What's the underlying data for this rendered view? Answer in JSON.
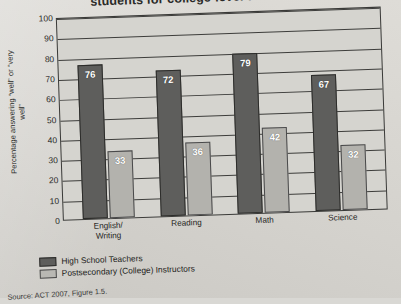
{
  "title": "students for college-level work?”",
  "title_right_fragment": "",
  "source": "Source: ACT 2007, Figure 1.5.",
  "legend": {
    "items": [
      {
        "label": "High School Teachers",
        "color": "#5e5e5c"
      },
      {
        "label": "Postsecondary (College) Instructors",
        "color": "#b9b8b3"
      }
    ]
  },
  "chart_data": {
    "type": "bar",
    "title": "students for college-level work?”",
    "xlabel": "",
    "ylabel": "Percentage answering “well” or “very well”",
    "ylim": [
      0,
      100
    ],
    "yticks": [
      0,
      10,
      20,
      30,
      40,
      50,
      60,
      70,
      80,
      90,
      100
    ],
    "grid": true,
    "legend_position": "below",
    "categories": [
      "English/\nWriting",
      "Reading",
      "Math",
      "Science"
    ],
    "category_labels": [
      {
        "line1": "English/",
        "line2": "Writing"
      },
      {
        "line1": "Reading",
        "line2": ""
      },
      {
        "line1": "Math",
        "line2": ""
      },
      {
        "line1": "Science",
        "line2": ""
      }
    ],
    "series": [
      {
        "name": "High School Teachers",
        "color": "#5e5e5c",
        "values": [
          76,
          72,
          79,
          67
        ]
      },
      {
        "name": "Postsecondary (College) Instructors",
        "color": "#b3b2ad",
        "values": [
          33,
          36,
          42,
          32
        ]
      }
    ],
    "source": "Source: ACT 2007, Figure 1.5."
  }
}
